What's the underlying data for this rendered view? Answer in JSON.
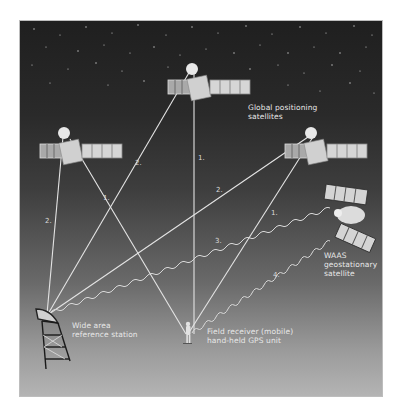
{
  "diagram": {
    "labels": {
      "gps_satellites": [
        "Global positioning",
        "satellites"
      ],
      "waas_satellite": [
        "WAAS",
        "geostationary",
        "satellite"
      ],
      "reference_station": [
        "Wide area",
        "reference station"
      ],
      "field_receiver": [
        "Field receiver (mobile)",
        "hand-held GPS unit"
      ]
    },
    "signal_numbers": {
      "left_sat_to_station": "2.",
      "left_sat_to_receiver": "1.",
      "top_sat_to_station": "2.",
      "top_sat_to_receiver": "1.",
      "right_sat_to_station": "2.",
      "right_sat_to_receiver": "1.",
      "waas_to_station": "3.",
      "waas_to_receiver": "4."
    },
    "colors": {
      "sky_top": "#1f1f1f",
      "ground": "#b4b4b4",
      "signal_line": "#e6e6e6",
      "label_text": "#e8e8e8"
    }
  }
}
